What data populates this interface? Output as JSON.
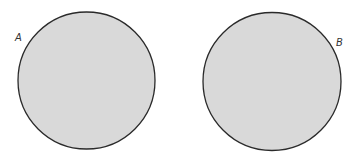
{
  "diagram": {
    "circles": [
      {
        "id": "A",
        "label": "A",
        "cx": 86.5,
        "cy": 80.5,
        "r": 68.5
      },
      {
        "id": "B",
        "label": "B",
        "cx": 272,
        "cy": 81.5,
        "r": 69
      }
    ],
    "colors": {
      "fill": "#d9d9d9",
      "stroke": "#2a2a2a",
      "background": "#ffffff"
    }
  }
}
